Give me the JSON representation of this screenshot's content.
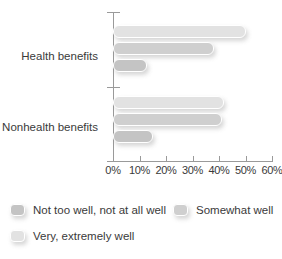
{
  "chart_data": {
    "type": "bar",
    "orientation": "horizontal",
    "title": "",
    "subtitle": "",
    "xlabel": "",
    "ylabel": "",
    "categories": [
      "Health benefits",
      "Nonhealth benefits"
    ],
    "series": [
      {
        "name": "Not too well, not at all well",
        "color": "#c4c4c4",
        "values": [
          13,
          15
        ]
      },
      {
        "name": "Somewhat well",
        "color": "#cfcfcf",
        "values": [
          38,
          41
        ]
      },
      {
        "name": "Very, extremely well",
        "color": "#e2e2e2",
        "values": [
          50,
          42
        ]
      }
    ],
    "xlim": [
      0,
      60
    ],
    "xticks": [
      0,
      10,
      20,
      30,
      40,
      50,
      60
    ],
    "xtick_labels": [
      "0%",
      "10%",
      "20%",
      "30%",
      "40%",
      "50%",
      "60%"
    ],
    "grid": false,
    "legend_position": "bottom-left",
    "value_suffix": "%"
  },
  "axis": {
    "ticks": [
      {
        "label": "0%",
        "value": 0
      },
      {
        "label": "10%",
        "value": 10
      },
      {
        "label": "20%",
        "value": 20
      },
      {
        "label": "30%",
        "value": 30
      },
      {
        "label": "40%",
        "value": 40
      },
      {
        "label": "50%",
        "value": 50
      },
      {
        "label": "60%",
        "value": 60
      }
    ]
  },
  "groups": [
    {
      "label": "Health benefits",
      "bars": [
        {
          "series": "Very, extremely well",
          "value": 50,
          "color": "#e2e2e2"
        },
        {
          "series": "Somewhat well",
          "value": 38,
          "color": "#cfcfcf"
        },
        {
          "series": "Not too well, not at all well",
          "value": 13,
          "color": "#c4c4c4"
        }
      ]
    },
    {
      "label": "Nonhealth benefits",
      "bars": [
        {
          "series": "Very, extremely well",
          "value": 42,
          "color": "#e2e2e2"
        },
        {
          "series": "Somewhat well",
          "value": 41,
          "color": "#cfcfcf"
        },
        {
          "series": "Not too well, not at all well",
          "value": 15,
          "color": "#c4c4c4"
        }
      ]
    }
  ],
  "legend": {
    "items": [
      {
        "label": "Not too well, not at all well",
        "color": "#c4c4c4"
      },
      {
        "label": "Somewhat well",
        "color": "#cfcfcf"
      },
      {
        "label": "Very, extremely well",
        "color": "#e2e2e2"
      }
    ]
  }
}
